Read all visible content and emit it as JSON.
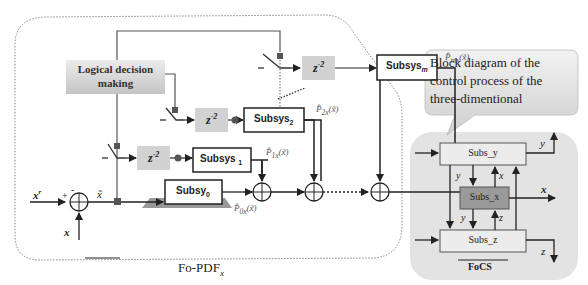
{
  "left_panel": {
    "caption": "Fo-PDF",
    "caption_sub": "x",
    "decision_block": {
      "line1": "Logical decision",
      "line2": "making"
    },
    "delay_label": "z",
    "delay_exp": "-2",
    "subsystems": [
      {
        "id": "subsys-0",
        "label": "Subsy",
        "sub": "0",
        "output": "P̂",
        "output_sub": "0x",
        "output_arg": "(x̃)"
      },
      {
        "id": "subsys-1",
        "label": "Subsys",
        "sub": "1",
        "output": "P̂",
        "output_sub": "1x",
        "output_arg": "(x̃)"
      },
      {
        "id": "subsys-2",
        "label": "Subsys",
        "sub": "2",
        "output": "P̂",
        "output_sub": "2x",
        "output_arg": "(x̃)"
      },
      {
        "id": "subsys-m",
        "label": "Subsys",
        "sub": "m",
        "output": "P̂",
        "output_sub": "mx",
        "output_arg": "(x̃)"
      }
    ],
    "input_ref": "x",
    "input_ref_sup": "r",
    "feedback": "x",
    "error": "x̃",
    "plus": "+",
    "minus": "-"
  },
  "callout": {
    "text_line1": "Block diagram of the",
    "text_line2": "control process of the",
    "text_line3": "three-dimentional"
  },
  "right_panel": {
    "caption": "FoCS",
    "blocks": {
      "y": "Subs_y",
      "x": "Subs_x",
      "z": "Subs_z"
    },
    "signals": {
      "y_out": "y",
      "x_out": "x",
      "z_out": "z",
      "y1": "y",
      "x1": "x",
      "y2": "y",
      "z1": "z"
    }
  },
  "colors": {
    "line": "#222222",
    "gray_block": "#d4d4d4",
    "dark_block": "#9a9a9a",
    "panel_bg": "#e3e3e3"
  }
}
